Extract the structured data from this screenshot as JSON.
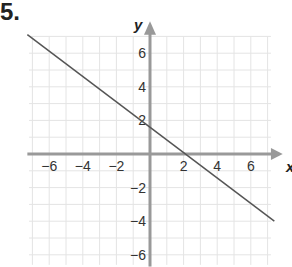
{
  "problem_number": "5.",
  "chart_data": {
    "type": "line",
    "title": "",
    "xlabel": "x",
    "ylabel": "y",
    "xlim": [
      -7,
      7.5
    ],
    "ylim": [
      -6.5,
      7
    ],
    "grid": true,
    "x_ticks": [
      -6,
      -4,
      -2,
      2,
      4,
      6
    ],
    "y_ticks": [
      6,
      4,
      2,
      -2,
      -4,
      -6
    ],
    "x_tick_labels": [
      "−6",
      "−4",
      "−2",
      "2",
      "4",
      "6"
    ],
    "y_tick_labels": [
      "6",
      "4",
      "2",
      "−2",
      "−4",
      "−6"
    ],
    "series": [
      {
        "name": "line",
        "x": [
          -7.3,
          7.4
        ],
        "y": [
          7.1,
          -4.0
        ],
        "equation": "y = -0.75x + 1.5"
      }
    ]
  },
  "colors": {
    "axis": "#999999",
    "grid": "#e4e4e4",
    "line": "#555555"
  }
}
